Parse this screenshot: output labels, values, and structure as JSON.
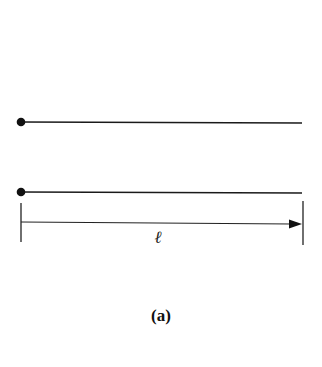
{
  "figure": {
    "caption": "(a)",
    "dimension_label": "ℓ",
    "colors": {
      "line": "#1a1a1a",
      "background": "#ffffff"
    },
    "elements": [
      {
        "type": "pinned-bar",
        "description": "upper bar with pinned end (dot) on left"
      },
      {
        "type": "pinned-bar",
        "description": "lower bar with pinned end (dot) on left"
      },
      {
        "type": "dimension-line",
        "description": "length arrow spanning bar length",
        "label": "ℓ"
      }
    ]
  }
}
